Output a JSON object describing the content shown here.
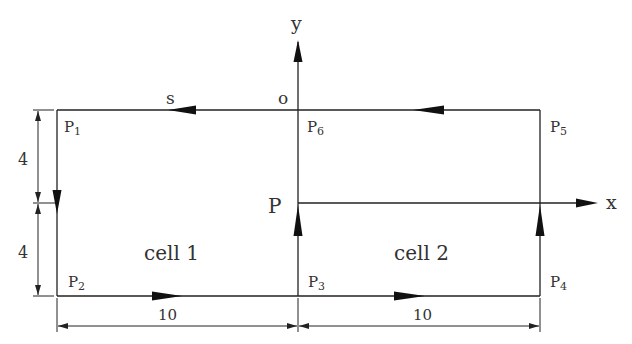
{
  "diagram": {
    "axes": {
      "x_label": "x",
      "y_label": "y",
      "origin_label": "o"
    },
    "flow_label": "s",
    "point_P_label": "P",
    "cells": [
      {
        "label": "cell 1"
      },
      {
        "label": "cell 2"
      }
    ],
    "points": [
      {
        "name": "P",
        "sub": "1"
      },
      {
        "name": "P",
        "sub": "2"
      },
      {
        "name": "P",
        "sub": "3"
      },
      {
        "name": "P",
        "sub": "4"
      },
      {
        "name": "P",
        "sub": "5"
      },
      {
        "name": "P",
        "sub": "6"
      }
    ],
    "dimensions": {
      "left_upper": "4",
      "left_lower": "4",
      "bottom_left": "10",
      "bottom_right": "10"
    },
    "colors": {
      "line": "#222222",
      "text": "#333333",
      "background": "#ffffff"
    }
  }
}
